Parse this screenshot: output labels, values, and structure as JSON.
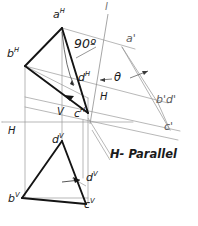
{
  "figure": {
    "type": "descriptive-geometry-orthographic-projection",
    "title": "",
    "colors": {
      "heavy_line": "#141414",
      "light_line": "#8c8c8c",
      "medium_line": "#4a4a4a",
      "background": "#ffffff",
      "text": "#1a1a1a"
    },
    "labels": {
      "a_h": {
        "base": "a",
        "sup": "H",
        "x": 53,
        "y": 10
      },
      "b_h": {
        "base": "b",
        "sup": "H",
        "x": 8,
        "y": 50
      },
      "c_h": {
        "base": "c",
        "sup": "H",
        "x": 78,
        "y": 111
      },
      "d_h": {
        "base": "d",
        "sup": "H",
        "x": 80,
        "y": 80
      },
      "a_v": {
        "base": "d",
        "sup": "V",
        "x": 53,
        "y": 137
      },
      "b_v": {
        "base": "b",
        "sup": "V",
        "x": 9,
        "y": 196
      },
      "c_v": {
        "base": "c",
        "sup": "V",
        "x": 84,
        "y": 200
      },
      "d_v": {
        "base": "d",
        "sup": "V",
        "x": 86,
        "y": 176
      },
      "a_prime": {
        "base": "a",
        "prime": "'",
        "x": 126,
        "y": 34
      },
      "bd_prime": {
        "base": "b'd'",
        "prime": "",
        "x": 157,
        "y": 96
      },
      "c_prime": {
        "base": "c",
        "prime": "'",
        "x": 165,
        "y": 124
      },
      "angle_90": {
        "text": "90",
        "symbol": "º",
        "x": 75,
        "y": 43
      },
      "theta": {
        "text": "θ",
        "x": 116,
        "y": 79
      },
      "axis_v": {
        "text": "V",
        "x": 58,
        "y": 110
      },
      "axis_h_left": {
        "text": "H",
        "x": 8,
        "y": 131
      },
      "axis_h_right": {
        "text": "H",
        "x": 101,
        "y": 96
      },
      "line_l": {
        "text": "l",
        "x": 106,
        "y": 4
      },
      "h_parallel": {
        "text": "H- Parallel",
        "x": 110,
        "y": 152
      }
    },
    "points": {
      "a_h": [
        62,
        28
      ],
      "b_h": [
        25,
        66
      ],
      "c_h": [
        88,
        115
      ],
      "d_h": [
        97,
        75
      ],
      "a_v": [
        62,
        141
      ],
      "b_v": [
        22,
        198
      ],
      "c_v": [
        86,
        204
      ],
      "d_v": [
        83,
        178
      ],
      "a_prime": [
        122,
        47
      ],
      "bd_prime": [
        158,
        103
      ],
      "c_prime": [
        168,
        129
      ],
      "l_top": [
        108,
        14
      ],
      "l_bottom": [
        92,
        122
      ]
    },
    "geometry_notes": {
      "ground_line_y": 122,
      "top_view_label": "H",
      "front_view_label": "V"
    }
  }
}
